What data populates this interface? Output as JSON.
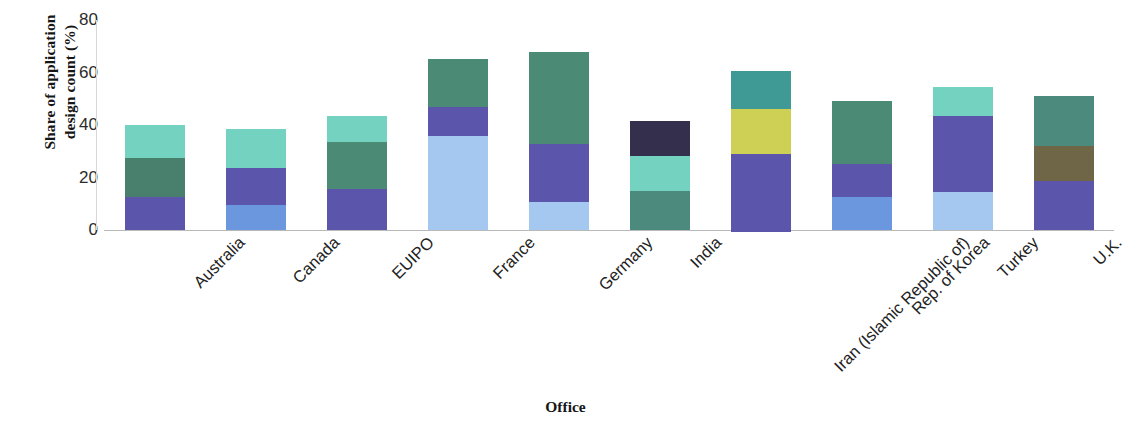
{
  "chart_data": {
    "type": "bar",
    "subtype": "stacked-bar",
    "title": "",
    "xlabel": "Office",
    "ylabel": "Share of application design count (%)",
    "ylim": [
      0,
      80
    ],
    "yticks": [
      0,
      20,
      40,
      60,
      80
    ],
    "ytick_labels": [
      "0",
      "20",
      "40",
      "60",
      "80"
    ],
    "grid": false,
    "legend": "none",
    "categories": [
      "Australia",
      "Canada",
      "EUIPO",
      "France",
      "Germany",
      "India",
      "Iran (Islamic Republic of)",
      "Rep. of Korea",
      "Turkey",
      "U.K."
    ],
    "stacks": [
      {
        "category": "Australia",
        "total": 40,
        "segments": [
          {
            "value": 12.7,
            "color": "#5b55ab"
          },
          {
            "value": 14.6,
            "color": "#49806d"
          },
          {
            "value": 12.7,
            "color": "#73d2c0"
          }
        ]
      },
      {
        "category": "Canada",
        "total": 38.6,
        "segments": [
          {
            "value": 9.6,
            "color": "#6a97dd"
          },
          {
            "value": 14.0,
            "color": "#5b55ab"
          },
          {
            "value": 15.0,
            "color": "#73d2c0"
          }
        ]
      },
      {
        "category": "EUIPO",
        "total": 43.6,
        "segments": [
          {
            "value": 15.6,
            "color": "#5b55ab"
          },
          {
            "value": 18.1,
            "color": "#4b8a74"
          },
          {
            "value": 9.9,
            "color": "#73d2c0"
          }
        ]
      },
      {
        "category": "France",
        "total": 65.0,
        "segments": [
          {
            "value": 35.9,
            "color": "#a4c8f0"
          },
          {
            "value": 11.0,
            "color": "#5b55ab"
          },
          {
            "value": 18.1,
            "color": "#4b8a74"
          }
        ]
      },
      {
        "category": "Germany",
        "total": 68.0,
        "segments": [
          {
            "value": 10.8,
            "color": "#a4c8f0"
          },
          {
            "value": 22.0,
            "color": "#5b55ab"
          },
          {
            "value": 35.2,
            "color": "#4b8a74"
          }
        ]
      },
      {
        "category": "India",
        "total": 41.7,
        "segments": [
          {
            "value": 14.9,
            "color": "#4b8a7c"
          },
          {
            "value": 13.4,
            "color": "#73d2c0"
          },
          {
            "value": 13.4,
            "color": "#332f4d"
          }
        ]
      },
      {
        "category": "Iran (Islamic Republic of)",
        "total": 60.4,
        "segments": [
          {
            "value": 29.6,
            "color": "#5b55ab"
          },
          {
            "value": 17.0,
            "color": "#cdd055"
          },
          {
            "value": 14.4,
            "color": "#3f9a96"
          }
        ]
      },
      {
        "category": "Rep. of Korea",
        "total": 49.0,
        "segments": [
          {
            "value": 12.5,
            "color": "#6a97dd"
          },
          {
            "value": 12.7,
            "color": "#5b55ab"
          },
          {
            "value": 23.8,
            "color": "#4b8a74"
          }
        ]
      },
      {
        "category": "Turkey",
        "total": 54.3,
        "segments": [
          {
            "value": 14.3,
            "color": "#a4c8f0"
          },
          {
            "value": 29.0,
            "color": "#5b55ab"
          },
          {
            "value": 11.0,
            "color": "#73d2c0"
          }
        ]
      },
      {
        "category": "U.K.",
        "total": 51.0,
        "segments": [
          {
            "value": 18.6,
            "color": "#5b55ab"
          },
          {
            "value": 13.5,
            "color": "#6e6647"
          },
          {
            "value": 18.9,
            "color": "#4b8a7c"
          }
        ]
      }
    ]
  },
  "axis": {
    "y_title": "Share of application\ndesign count (%)",
    "y_title_line1": "Share of application",
    "y_title_line2": "design count (%)",
    "x_title": "Office"
  }
}
